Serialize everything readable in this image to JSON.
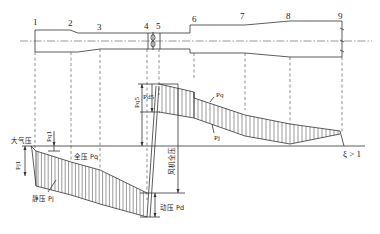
{
  "section_numbers": [
    "1",
    "2",
    "3",
    "4",
    "5",
    "6",
    "7",
    "8",
    "9"
  ],
  "labels": {
    "atmospheric_pressure": "大气压",
    "total_pressure": "全压 Pq",
    "static_pressure": "静压 Pj",
    "dynamic_pressure": "动压 Pd",
    "fan_total_pressure": "风机全压",
    "pq1": "Pq1",
    "pj1": "Pj1",
    "pq5": "Pq5",
    "pd5": "Pd5",
    "pq": "Pq",
    "pj": "Pj",
    "xi": "ξ > 1"
  }
}
